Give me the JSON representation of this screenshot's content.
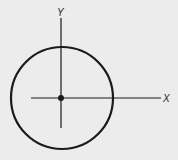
{
  "diagram": {
    "x_label": "X",
    "y_label": "Y",
    "colors": {
      "background": "#ececec",
      "stroke": "#1a1a1a"
    },
    "circle": {
      "cx": 62,
      "cy": 98,
      "r": 51
    },
    "center_point": {
      "cx": 61,
      "cy": 98
    }
  }
}
